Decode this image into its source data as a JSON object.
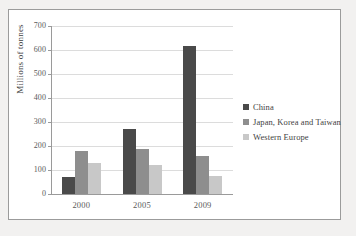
{
  "chart_data": {
    "type": "bar",
    "title": "",
    "xlabel": "",
    "ylabel": "Millions of tonnes",
    "categories": [
      "2000",
      "2005",
      "2009"
    ],
    "series": [
      {
        "name": "China",
        "color": "#4a4a4a",
        "values": [
          72,
          271,
          615
        ]
      },
      {
        "name": "Japan, Korea and Taiwan",
        "color": "#8e8e8e",
        "values": [
          181,
          187,
          158
        ]
      },
      {
        "name": "Western Europe",
        "color": "#c8c8c8",
        "values": [
          128,
          120,
          77
        ]
      }
    ],
    "ylim": [
      0,
      700
    ],
    "ytick_step": 100,
    "yticks": [
      "700",
      "600",
      "500",
      "400",
      "300",
      "200",
      "100",
      "0"
    ],
    "grid": true,
    "legend_position": "right"
  },
  "colors": {
    "page_background": "#f2f1f0",
    "panel_background": "#ffffff",
    "panel_border": "#9b9b9b",
    "gridline": "#dcdcdc",
    "axis": "#9a9a9a",
    "text": "#3f3f3f",
    "tick_text": "#5a5a5a"
  }
}
